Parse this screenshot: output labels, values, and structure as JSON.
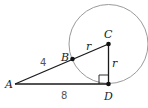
{
  "diagram": {
    "type": "geometry",
    "circle": {
      "center": "C",
      "cx": 108.5,
      "cy": 44,
      "r": 39.5,
      "color": "#9a9a9a"
    },
    "points": [
      {
        "name": "A",
        "x": 15,
        "y": 84,
        "label": "A"
      },
      {
        "name": "B",
        "x": 72.5,
        "y": 59,
        "label": "B"
      },
      {
        "name": "C",
        "x": 108.5,
        "y": 44,
        "label": "C"
      },
      {
        "name": "D",
        "x": 108.5,
        "y": 84,
        "label": "D"
      }
    ],
    "segments": [
      {
        "from": "A",
        "to": "C"
      },
      {
        "from": "A",
        "to": "D"
      },
      {
        "from": "C",
        "to": "D"
      }
    ],
    "right_angle_at": "D",
    "segment_labels": {
      "BC": "r",
      "CD": "r",
      "AB": "4",
      "AD": "8"
    },
    "line_color": "#1a1a1a"
  }
}
